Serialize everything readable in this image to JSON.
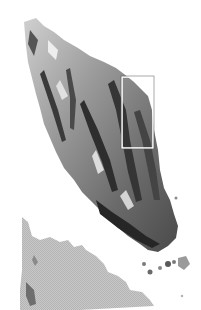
{
  "map": {
    "style": "grayscale shaded relief",
    "background_color": "#ffffff",
    "features": [
      {
        "name": "peninsula",
        "shade": "relief",
        "base_color": "#8a8a8a",
        "dark_color": "#2a2a2a",
        "light_color": "#d8d8d8"
      },
      {
        "name": "southern-landmass",
        "shade": "flat",
        "base_color": "#c4c4c4"
      },
      {
        "name": "islands",
        "shade": "relief",
        "base_color": "#7a7a7a"
      }
    ],
    "inset_box": {
      "x": 122,
      "y": 77,
      "width": 31,
      "height": 71,
      "stroke_color": "#ffffff"
    }
  }
}
